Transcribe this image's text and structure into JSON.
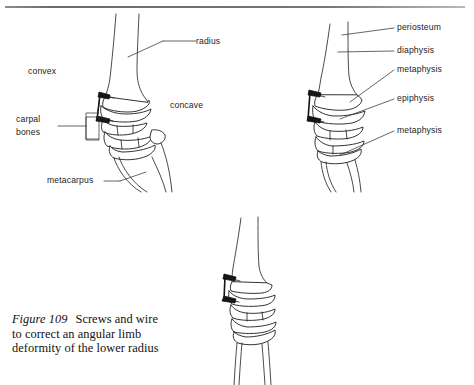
{
  "page": {
    "background": "#ffffff",
    "ink_color": "#1c1c1c",
    "rule_color": "#767676"
  },
  "figures": [
    {
      "id": "figure-left",
      "name": "lateral-view-angular-deformity",
      "labels": [
        {
          "key": "radius",
          "text": "radius"
        },
        {
          "key": "convex",
          "text": "convex"
        },
        {
          "key": "concave",
          "text": "concave"
        },
        {
          "key": "carpal_bones",
          "line1": "carpal",
          "line2": "bones"
        },
        {
          "key": "metacarpus",
          "text": "metacarpus"
        }
      ]
    },
    {
      "id": "figure-right",
      "name": "bone-regions-annotated",
      "labels": [
        {
          "key": "periosteum",
          "text": "periosteum"
        },
        {
          "key": "diaphysis",
          "text": "diaphysis"
        },
        {
          "key": "metaphysis_upper",
          "text": "metaphysis"
        },
        {
          "key": "epiphysis",
          "text": "epiphysis"
        },
        {
          "key": "metaphysis_lower",
          "text": "metaphysis"
        }
      ]
    },
    {
      "id": "figure-bottom",
      "name": "cranial-view-corrected-limb",
      "labels": []
    }
  ],
  "labels_left": {
    "radius": "radius",
    "convex": "convex",
    "concave": "concave",
    "carpal_line1": "carpal",
    "carpal_line2": "bones",
    "metacarpus": "metacarpus"
  },
  "labels_right": {
    "periosteum": "periosteum",
    "diaphysis": "diaphysis",
    "metaphysis_upper": "metaphysis",
    "epiphysis": "epiphysis",
    "metaphysis_lower": "metaphysis"
  },
  "caption": {
    "figure_number": "Figure 109",
    "text": "Screws and wire to correct an angular limb deformity of the lower radius"
  }
}
